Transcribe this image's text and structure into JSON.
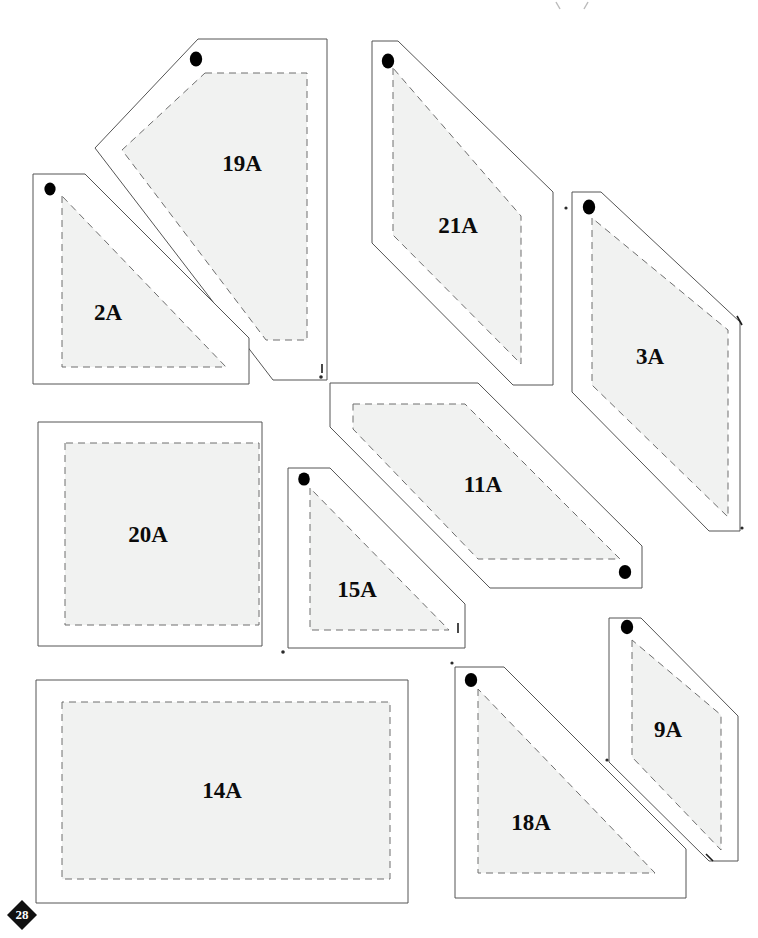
{
  "page": {
    "page_number": "28",
    "background_color": "#ffffff",
    "piece_fill_color": "#f1f2f1",
    "outline_color": "#555555",
    "seam_line_color": "#6e6e6e",
    "label_color": "#0b0b0b",
    "dot_color": "#000000"
  },
  "top_mark": {
    "name": "partial-crop-mark",
    "visible": true
  },
  "pieces": [
    {
      "id": "19A",
      "label": "19A",
      "shape": "pentagon",
      "label_x": 242,
      "label_y": 166,
      "outline": "198,39 327,39 327,380 273,380 95,148",
      "seam": "205,73 307,73 307,340 266,340 122,150",
      "dot": {
        "x": 196,
        "y": 59,
        "rx": 6.2,
        "ry": 7.4
      }
    },
    {
      "id": "2A",
      "label": "2A",
      "shape": "right-triangle",
      "label_x": 108,
      "label_y": 315,
      "outline": "33,174 85,174 249,338 249,384 33,384",
      "seam": "62,196 62,367 226,367",
      "dot": {
        "x": 50,
        "y": 189,
        "rx": 5.6,
        "ry": 6.4
      }
    },
    {
      "id": "21A",
      "label": "21A",
      "shape": "kite",
      "label_x": 458,
      "label_y": 228,
      "outline": "372,41 398,41 553,192 553,385 513,385 372,243",
      "seam": "393,68 393,235 521,364 521,216",
      "dot": {
        "x": 388,
        "y": 61,
        "rx": 6.2,
        "ry": 7.4
      }
    },
    {
      "id": "3A",
      "label": "3A",
      "shape": "parallelogram",
      "label_x": 650,
      "label_y": 359,
      "outline": "572,192 601,192 740,322 740,531 709,531 572,392",
      "seam": "592,218 592,385 728,517 728,330",
      "dot": {
        "x": 589,
        "y": 207,
        "rx": 6.2,
        "ry": 7.4
      }
    },
    {
      "id": "20A",
      "label": "20A",
      "shape": "square",
      "label_x": 148,
      "label_y": 537,
      "outline": "38,422 262,422 262,646 38,646",
      "seam": "65,443 65,625 259,625 259,443",
      "dot": null
    },
    {
      "id": "11A",
      "label": "11A",
      "shape": "hexagon",
      "label_x": 483,
      "label_y": 487,
      "outline": "330,383 478,383 642,546 642,588 490,588 330,427",
      "seam": "353,404 465,404 620,559 478,559 353,429",
      "dot": {
        "x": 625,
        "y": 572,
        "rx": 6.2,
        "ry": 6.9
      }
    },
    {
      "id": "15A",
      "label": "15A",
      "shape": "right-triangle",
      "label_x": 357,
      "label_y": 592,
      "outline": "288,468 330,468 465,604 465,648 288,648",
      "seam": "310,488 310,630 449,630",
      "dot": {
        "x": 304,
        "y": 479,
        "rx": 5.8,
        "ry": 6.6
      }
    },
    {
      "id": "14A",
      "label": "14A",
      "shape": "rectangle",
      "label_x": 222,
      "label_y": 793,
      "outline": "36,680 408,680 408,903 36,903",
      "seam": "62,702 62,879 390,879 390,702",
      "dot": null
    },
    {
      "id": "18A",
      "label": "18A",
      "shape": "right-triangle",
      "label_x": 531,
      "label_y": 825,
      "outline": "455,667 504,667 686,849 686,898 455,898",
      "seam": "478,689 478,873 655,873",
      "dot": {
        "x": 471,
        "y": 680,
        "rx": 6.2,
        "ry": 6.9
      }
    },
    {
      "id": "9A",
      "label": "9A",
      "shape": "parallelogram",
      "label_x": 668,
      "label_y": 732,
      "outline": "609,618 641,618 738,716 738,861 709,861 609,762",
      "seam": "632,640 632,757 721,850 721,715",
      "dot": {
        "x": 627,
        "y": 627,
        "rx": 6.2,
        "ry": 7.2
      }
    }
  ],
  "registration_marks": [
    {
      "name": "speck-upper-center",
      "x": 321,
      "y": 377,
      "r": 1.8
    },
    {
      "name": "tick-upper-center",
      "x": 322,
      "y": 368,
      "h": 9
    },
    {
      "name": "speck-left-of-3a",
      "x": 566,
      "y": 208,
      "r": 1.6
    },
    {
      "name": "tick-right-of-15a",
      "x": 458,
      "y": 629,
      "h": 10
    },
    {
      "name": "speck-below-15a",
      "x": 283,
      "y": 652,
      "r": 1.8
    },
    {
      "name": "speck-left-of-18a",
      "x": 452,
      "y": 663,
      "r": 1.6
    },
    {
      "name": "tick-right-of-3a-upper",
      "x": 740,
      "y": 320,
      "h": 10
    },
    {
      "name": "speck-right-of-3a-lower",
      "x": 742,
      "y": 528,
      "r": 1.6
    },
    {
      "name": "tick-right-of-9a",
      "x": 710,
      "y": 857,
      "h": 9
    },
    {
      "name": "speck-right-of-9a-upper",
      "x": 607,
      "y": 760,
      "r": 1.6
    }
  ],
  "page_badge": {
    "number": "28",
    "cx": 22,
    "cy": 915,
    "size": 15
  }
}
